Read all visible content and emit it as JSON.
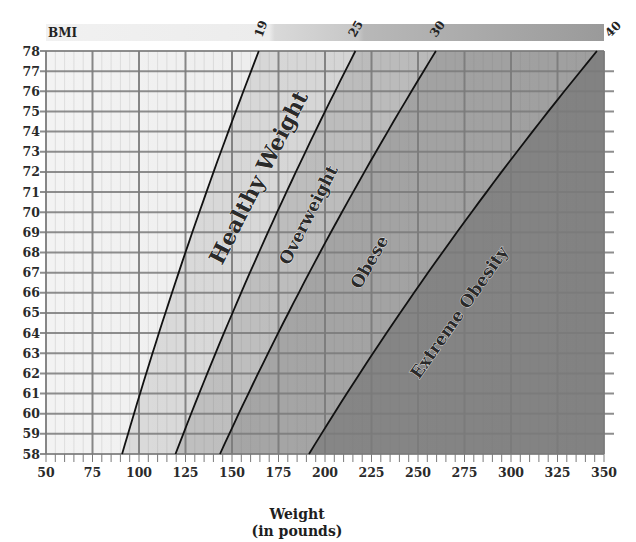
{
  "chart_data": {
    "type": "line",
    "title": "BMI",
    "xlabel": "Weight (in pounds)",
    "xlabel_lines": [
      "Weight",
      "(in pounds)"
    ],
    "ylabel": "Height (in inches)",
    "xlim": [
      50,
      350
    ],
    "ylim": [
      58,
      78
    ],
    "x_ticks": [
      50,
      75,
      100,
      125,
      150,
      175,
      200,
      225,
      250,
      275,
      300,
      325,
      350
    ],
    "y_ticks": [
      58,
      59,
      60,
      61,
      62,
      63,
      64,
      65,
      66,
      67,
      68,
      69,
      70,
      71,
      72,
      73,
      74,
      75,
      76,
      77,
      78
    ],
    "grid": true,
    "bmi_legend_bar": {
      "label": "BMI",
      "markers": [
        "19",
        "25",
        "30",
        "40"
      ]
    },
    "series": [
      {
        "name": "BMI 19",
        "bmi": 19,
        "points": [
          [
            91,
            58
          ],
          [
            164,
            78
          ]
        ]
      },
      {
        "name": "BMI 25",
        "bmi": 25,
        "points": [
          [
            119,
            58
          ],
          [
            216,
            78
          ]
        ]
      },
      {
        "name": "BMI 30",
        "bmi": 30,
        "points": [
          [
            143,
            58
          ],
          [
            260,
            78
          ]
        ]
      },
      {
        "name": "BMI 40",
        "bmi": 40,
        "points": [
          [
            191,
            58
          ],
          [
            346,
            78
          ]
        ]
      }
    ],
    "regions": [
      {
        "name": "Healthy Weight",
        "from_bmi": 19,
        "to_bmi": 25
      },
      {
        "name": "Overweight",
        "from_bmi": 25,
        "to_bmi": 30
      },
      {
        "name": "Obese",
        "from_bmi": 30,
        "to_bmi": 40
      },
      {
        "name": "Extreme Obesity",
        "from_bmi": 40,
        "to_bmi": null
      }
    ]
  },
  "labels": {
    "bmi": "BMI",
    "b19": "19",
    "b25": "25",
    "b30": "30",
    "b40": "40",
    "healthy": "Healthy Weight",
    "overweight": "Overweight",
    "obese": "Obese",
    "extreme": "Extreme Obesity",
    "xtitle1": "Weight",
    "xtitle2": "(in pounds)"
  },
  "colors": {
    "underweight": "#f3f3f3",
    "healthy": "#dcdcdc",
    "overweight": "#c2c2c2",
    "obese": "#a9a9a9",
    "extreme": "#8a8a8a",
    "grid": "#7a7a7a",
    "curve": "#111111"
  }
}
